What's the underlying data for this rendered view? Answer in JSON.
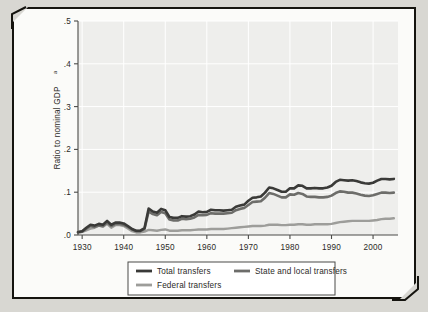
{
  "figure": {
    "frame_color": "#15140f",
    "page_background": "#d8d7d2",
    "panel_background": "#eeeeec"
  },
  "chart_data": {
    "type": "line",
    "title": "",
    "subtitle": "",
    "xlabel": "",
    "ylabel": "Ratio to nominal GDP",
    "ylabel_superscript": "a",
    "xlim": [
      1929,
      2006
    ],
    "ylim": [
      0.0,
      0.5
    ],
    "xticks": [
      1930,
      1940,
      1950,
      1960,
      1970,
      1980,
      1990,
      2000
    ],
    "xtick_labels": [
      "1930",
      "1940",
      "1950",
      "1960",
      "1970",
      "1980",
      "1990",
      "2000"
    ],
    "yticks": [
      0.0,
      0.1,
      0.2,
      0.3,
      0.4,
      0.5
    ],
    "ytick_labels": [
      ".0",
      ".1",
      ".2",
      ".3",
      ".4",
      ".5"
    ],
    "grid": "horizontal and vertical white gridlines on light gray panel",
    "legend_position": "below plot, bordered box",
    "series": [
      {
        "name": "Total transfers",
        "color": "#3a3a38",
        "width": 2.6,
        "x": [
          1929,
          1930,
          1931,
          1932,
          1933,
          1934,
          1935,
          1936,
          1937,
          1938,
          1939,
          1940,
          1941,
          1942,
          1943,
          1944,
          1945,
          1946,
          1947,
          1948,
          1949,
          1950,
          1951,
          1952,
          1953,
          1954,
          1955,
          1956,
          1957,
          1958,
          1959,
          1960,
          1961,
          1962,
          1963,
          1964,
          1965,
          1966,
          1967,
          1968,
          1969,
          1970,
          1971,
          1972,
          1973,
          1974,
          1975,
          1976,
          1977,
          1978,
          1979,
          1980,
          1981,
          1982,
          1983,
          1984,
          1985,
          1986,
          1987,
          1988,
          1989,
          1990,
          1991,
          1992,
          1993,
          1994,
          1995,
          1996,
          1997,
          1998,
          1999,
          2000,
          2001,
          2002,
          2003,
          2004,
          2005
        ],
        "values": [
          0.007,
          0.009,
          0.017,
          0.024,
          0.022,
          0.026,
          0.024,
          0.033,
          0.024,
          0.029,
          0.029,
          0.027,
          0.021,
          0.014,
          0.01,
          0.01,
          0.016,
          0.062,
          0.055,
          0.052,
          0.061,
          0.058,
          0.042,
          0.04,
          0.04,
          0.044,
          0.043,
          0.044,
          0.048,
          0.055,
          0.053,
          0.054,
          0.059,
          0.058,
          0.058,
          0.057,
          0.058,
          0.059,
          0.066,
          0.069,
          0.071,
          0.08,
          0.087,
          0.088,
          0.09,
          0.099,
          0.111,
          0.109,
          0.105,
          0.101,
          0.101,
          0.109,
          0.109,
          0.116,
          0.115,
          0.109,
          0.109,
          0.11,
          0.109,
          0.109,
          0.111,
          0.115,
          0.124,
          0.129,
          0.128,
          0.127,
          0.128,
          0.126,
          0.123,
          0.121,
          0.12,
          0.122,
          0.127,
          0.131,
          0.131,
          0.13,
          0.131
        ]
      },
      {
        "name": "State and local transfers",
        "color": "#6d6d6a",
        "width": 2.6,
        "x": [
          1929,
          1930,
          1931,
          1932,
          1933,
          1934,
          1935,
          1936,
          1937,
          1938,
          1939,
          1940,
          1941,
          1942,
          1943,
          1944,
          1945,
          1946,
          1947,
          1948,
          1949,
          1950,
          1951,
          1952,
          1953,
          1954,
          1955,
          1956,
          1957,
          1958,
          1959,
          1960,
          1961,
          1962,
          1963,
          1964,
          1965,
          1966,
          1967,
          1968,
          1969,
          1970,
          1971,
          1972,
          1973,
          1974,
          1975,
          1976,
          1977,
          1978,
          1979,
          1980,
          1981,
          1982,
          1983,
          1984,
          1985,
          1986,
          1987,
          1988,
          1989,
          1990,
          1991,
          1992,
          1993,
          1994,
          1995,
          1996,
          1997,
          1998,
          1999,
          2000,
          2001,
          2002,
          2003,
          2004,
          2005
        ],
        "values": [
          0.006,
          0.008,
          0.015,
          0.021,
          0.019,
          0.022,
          0.021,
          0.029,
          0.021,
          0.026,
          0.026,
          0.024,
          0.019,
          0.013,
          0.009,
          0.009,
          0.014,
          0.055,
          0.049,
          0.046,
          0.054,
          0.051,
          0.036,
          0.034,
          0.034,
          0.038,
          0.037,
          0.038,
          0.041,
          0.047,
          0.046,
          0.047,
          0.051,
          0.05,
          0.05,
          0.05,
          0.051,
          0.052,
          0.058,
          0.061,
          0.063,
          0.07,
          0.077,
          0.078,
          0.079,
          0.087,
          0.098,
          0.096,
          0.092,
          0.088,
          0.088,
          0.095,
          0.094,
          0.098,
          0.096,
          0.09,
          0.089,
          0.089,
          0.088,
          0.088,
          0.089,
          0.092,
          0.098,
          0.102,
          0.101,
          0.099,
          0.099,
          0.097,
          0.094,
          0.092,
          0.091,
          0.093,
          0.096,
          0.099,
          0.099,
          0.098,
          0.099
        ]
      },
      {
        "name": "Federal transfers",
        "color": "#9d9d9a",
        "width": 2.4,
        "x": [
          1929,
          1930,
          1931,
          1932,
          1933,
          1934,
          1935,
          1936,
          1937,
          1938,
          1939,
          1940,
          1941,
          1942,
          1943,
          1944,
          1945,
          1946,
          1947,
          1948,
          1949,
          1950,
          1951,
          1952,
          1953,
          1954,
          1955,
          1956,
          1957,
          1958,
          1959,
          1960,
          1961,
          1962,
          1963,
          1964,
          1965,
          1966,
          1967,
          1968,
          1969,
          1970,
          1971,
          1972,
          1973,
          1974,
          1975,
          1976,
          1977,
          1978,
          1979,
          1980,
          1981,
          1982,
          1983,
          1984,
          1985,
          1986,
          1987,
          1988,
          1989,
          1990,
          1991,
          1992,
          1993,
          1994,
          1995,
          1996,
          1997,
          1998,
          1999,
          2000,
          2001,
          2002,
          2003,
          2004,
          2005
        ],
        "values": [
          0.006,
          0.007,
          0.011,
          0.015,
          0.017,
          0.022,
          0.019,
          0.026,
          0.017,
          0.023,
          0.023,
          0.021,
          0.015,
          0.009,
          0.006,
          0.006,
          0.008,
          0.012,
          0.011,
          0.01,
          0.012,
          0.013,
          0.01,
          0.01,
          0.01,
          0.011,
          0.011,
          0.011,
          0.012,
          0.013,
          0.013,
          0.013,
          0.014,
          0.014,
          0.014,
          0.014,
          0.015,
          0.016,
          0.017,
          0.018,
          0.019,
          0.02,
          0.021,
          0.021,
          0.021,
          0.022,
          0.024,
          0.024,
          0.024,
          0.023,
          0.023,
          0.024,
          0.024,
          0.025,
          0.025,
          0.024,
          0.024,
          0.025,
          0.025,
          0.025,
          0.025,
          0.026,
          0.028,
          0.03,
          0.031,
          0.032,
          0.033,
          0.033,
          0.033,
          0.033,
          0.033,
          0.034,
          0.035,
          0.037,
          0.038,
          0.038,
          0.039
        ]
      }
    ]
  },
  "legend": {
    "entries": [
      {
        "label": "Total transfers",
        "color": "#3a3a38"
      },
      {
        "label": "State and local transfers",
        "color": "#6d6d6a"
      },
      {
        "label": "Federal transfers",
        "color": "#9d9d9a"
      }
    ]
  }
}
